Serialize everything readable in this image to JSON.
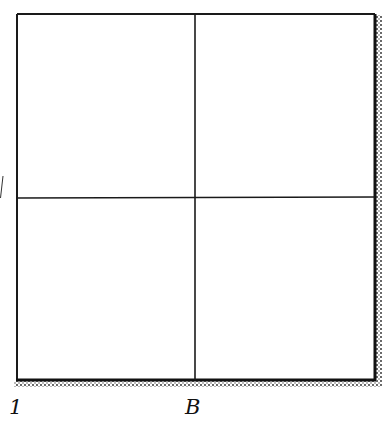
{
  "diagram": {
    "labels": {
      "bottom_left": "1",
      "bottom_middle": "B"
    },
    "colors": {
      "line": "#1a1a1a",
      "background": "#ffffff",
      "shadow": "#222222"
    }
  }
}
